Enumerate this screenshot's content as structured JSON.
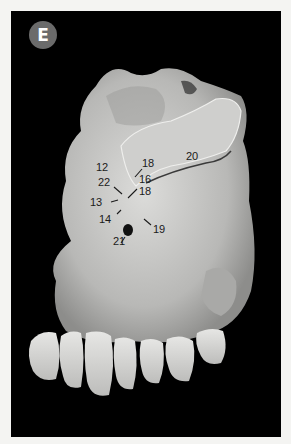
{
  "figure": {
    "panel_label": "E",
    "labels": [
      {
        "id": "12",
        "text": "12"
      },
      {
        "id": "13",
        "text": "13"
      },
      {
        "id": "14",
        "text": "14"
      },
      {
        "id": "16",
        "text": "16"
      },
      {
        "id": "17",
        "text": "17"
      },
      {
        "id": "18",
        "text": "18"
      },
      {
        "id": "19",
        "text": "19"
      },
      {
        "id": "20",
        "text": "20"
      },
      {
        "id": "21",
        "text": "21"
      },
      {
        "id": "22",
        "text": "22"
      }
    ]
  },
  "colors": {
    "background": "#000000",
    "page": "#f4f4f2",
    "badge": "#6b6b6b",
    "bone": "#c8c8c6"
  }
}
